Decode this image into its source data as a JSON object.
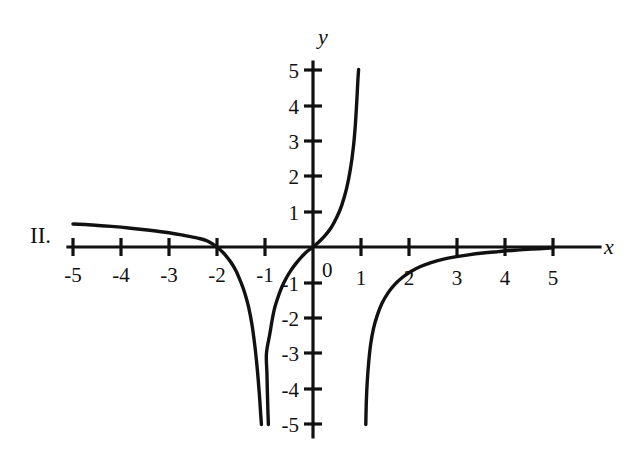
{
  "figure": {
    "panel_label": "II.",
    "background_color": "#ffffff",
    "ink_color": "#111111"
  },
  "chart_data": {
    "type": "line",
    "title": "",
    "subtitle": "",
    "xlabel": "x",
    "ylabel": "y",
    "xlim": [
      -5,
      5
    ],
    "ylim": [
      -5,
      5
    ],
    "grid": false,
    "legend": null,
    "origin_label": "0",
    "x_ticks": [
      -5,
      -4,
      -3,
      -2,
      -1,
      1,
      2,
      3,
      4,
      5
    ],
    "x_tick_labels": [
      "-5",
      "-4",
      "-3",
      "-2",
      "-1",
      "1",
      "2",
      "3",
      "4",
      "5"
    ],
    "y_ticks": [
      5,
      4,
      3,
      2,
      1,
      -1,
      -2,
      -3,
      -4,
      -5
    ],
    "y_tick_labels": [
      "5",
      "4",
      "3",
      "2",
      "1",
      "-1",
      "-2",
      "-3",
      "-4",
      "-5"
    ],
    "vertical_asymptotes": [
      -1,
      1
    ],
    "horizontal_asymptote": 0,
    "x_intercepts": [
      -2,
      0
    ],
    "y_intercepts": [
      0
    ],
    "series": [
      {
        "name": "branch-left",
        "comment": "x from -5 to just left of -1; starts near y=0.65, crosses x-axis at x=-2, plunges to -5",
        "points": [
          [
            -5.0,
            0.65
          ],
          [
            -4.6,
            0.62
          ],
          [
            -4.2,
            0.58
          ],
          [
            -3.8,
            0.53
          ],
          [
            -3.4,
            0.47
          ],
          [
            -3.0,
            0.4
          ],
          [
            -2.7,
            0.33
          ],
          [
            -2.4,
            0.25
          ],
          [
            -2.2,
            0.17
          ],
          [
            -2.0,
            0.0
          ],
          [
            -1.9,
            -0.12
          ],
          [
            -1.8,
            -0.27
          ],
          [
            -1.7,
            -0.45
          ],
          [
            -1.6,
            -0.68
          ],
          [
            -1.5,
            -1.0
          ],
          [
            -1.42,
            -1.3
          ],
          [
            -1.34,
            -1.7
          ],
          [
            -1.27,
            -2.2
          ],
          [
            -1.21,
            -2.8
          ],
          [
            -1.16,
            -3.45
          ],
          [
            -1.12,
            -4.1
          ],
          [
            -1.09,
            -4.7
          ],
          [
            -1.075,
            -5.0
          ]
        ]
      },
      {
        "name": "branch-middle",
        "comment": "x from just right of -1 to just left of 1; rises from -5, passes through origin, soars to +5",
        "points": [
          [
            -0.93,
            -5.0
          ],
          [
            -0.94,
            -4.6
          ],
          [
            -0.95,
            -4.1
          ],
          [
            -0.96,
            -3.55
          ],
          [
            -0.97,
            -3.0
          ],
          [
            -0.9,
            -2.45
          ],
          [
            -0.85,
            -2.05
          ],
          [
            -0.8,
            -1.72
          ],
          [
            -0.72,
            -1.38
          ],
          [
            -0.64,
            -1.1
          ],
          [
            -0.55,
            -0.86
          ],
          [
            -0.46,
            -0.66
          ],
          [
            -0.37,
            -0.49
          ],
          [
            -0.28,
            -0.34
          ],
          [
            -0.19,
            -0.21
          ],
          [
            -0.1,
            -0.1
          ],
          [
            0.0,
            0.0
          ],
          [
            0.12,
            0.14
          ],
          [
            0.25,
            0.32
          ],
          [
            0.38,
            0.55
          ],
          [
            0.5,
            0.85
          ],
          [
            0.6,
            1.18
          ],
          [
            0.7,
            1.65
          ],
          [
            0.78,
            2.2
          ],
          [
            0.84,
            2.8
          ],
          [
            0.88,
            3.4
          ],
          [
            0.91,
            4.05
          ],
          [
            0.935,
            4.7
          ],
          [
            0.95,
            5.0
          ]
        ]
      },
      {
        "name": "branch-right",
        "comment": "x from just right of 1 to 5; rises from -5 and flattens toward y=0 near x=5",
        "points": [
          [
            1.1,
            -5.0
          ],
          [
            1.11,
            -4.4
          ],
          [
            1.13,
            -3.8
          ],
          [
            1.16,
            -3.25
          ],
          [
            1.2,
            -2.75
          ],
          [
            1.26,
            -2.3
          ],
          [
            1.34,
            -1.92
          ],
          [
            1.44,
            -1.58
          ],
          [
            1.56,
            -1.3
          ],
          [
            1.7,
            -1.06
          ],
          [
            1.86,
            -0.86
          ],
          [
            2.04,
            -0.69
          ],
          [
            2.24,
            -0.55
          ],
          [
            2.46,
            -0.44
          ],
          [
            2.7,
            -0.35
          ],
          [
            2.96,
            -0.28
          ],
          [
            3.24,
            -0.22
          ],
          [
            3.54,
            -0.17
          ],
          [
            3.86,
            -0.13
          ],
          [
            4.2,
            -0.09
          ],
          [
            4.56,
            -0.06
          ],
          [
            4.94,
            -0.03
          ],
          [
            5.0,
            -0.02
          ]
        ]
      }
    ]
  }
}
